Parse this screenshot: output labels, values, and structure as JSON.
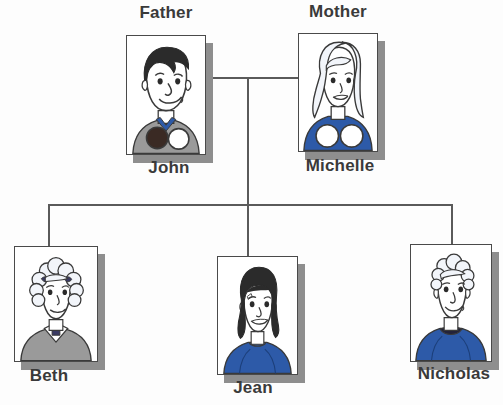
{
  "diagram": {
    "type": "family-tree"
  },
  "people": {
    "father": {
      "role": "Father",
      "name": "John",
      "hair_color": "#2b2b2b",
      "clothing_color": "#9a9a9a",
      "clothing": "gray sweater",
      "accent": "two circles at collar, one dark one white"
    },
    "mother": {
      "role": "Mother",
      "name": "Michelle",
      "hair_color": "#eef1f6",
      "clothing_color": "#2d5aa8",
      "clothing": "blue top",
      "accent": "two white circles"
    },
    "child1": {
      "role": "",
      "name": "Beth",
      "hair_color": "#eef1f6",
      "clothing_color": "#9a9a9a",
      "clothing": "gray sweater with white collar",
      "accent": "curly hair with dark bows"
    },
    "child2": {
      "role": "",
      "name": "Jean",
      "hair_color": "#2b2b2b",
      "clothing_color": "#2d5aa8",
      "clothing": "blue sweater",
      "accent": "dark wavy hair"
    },
    "child3": {
      "role": "",
      "name": "Nicholas",
      "hair_color": "#eef1f6",
      "clothing_color": "#2d5aa8",
      "clothing": "blue sweater with dark collar",
      "accent": "light curly hair"
    }
  },
  "colors": {
    "line": "#5a5a5a",
    "shadow": "#8e8e8e",
    "text": "#3a3a3a",
    "blue": "#2d5aa8",
    "gray": "#9a9a9a",
    "skin": "#ffffff",
    "outline": "#3a3a3a",
    "background": "#fdfdfd"
  }
}
